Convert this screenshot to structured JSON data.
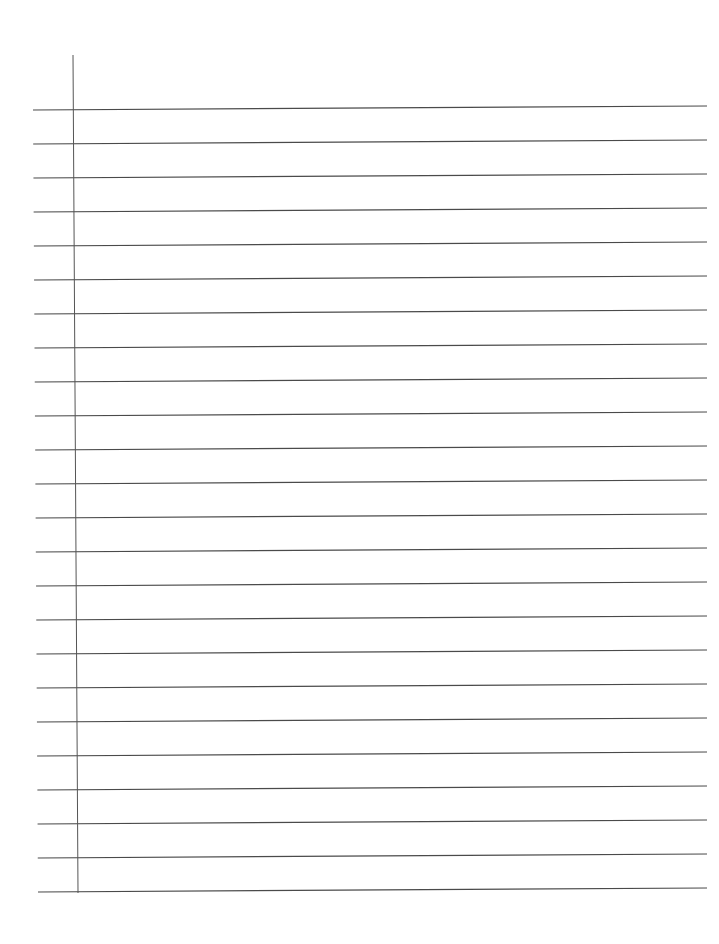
{
  "page": {
    "type": "lined-paper",
    "background_color": "#ffffff",
    "rule_color": "#4a4a4a",
    "margin_line_color": "#555555",
    "rule_count": 24,
    "first_rule_y": 110,
    "rule_spacing": 34,
    "rule_left_x_top": 33,
    "rule_left_x_bottom": 38,
    "rule_right_x": 707,
    "right_end_y_offset": -4,
    "margin_line": {
      "x_top": 73,
      "y_top": 55,
      "x_bottom": 78,
      "y_bottom": 893
    }
  }
}
